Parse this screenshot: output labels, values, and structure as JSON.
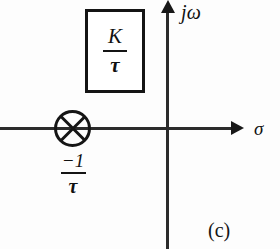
{
  "figure": {
    "subfigure_label": "(c)"
  },
  "axes": {
    "vertical_label": "jω",
    "horizontal_label": "σ",
    "origin": {
      "x": 167,
      "y": 128
    }
  },
  "gain_box": {
    "numerator": "K",
    "bar": "",
    "denominator": "τ",
    "value_text": "K/τ"
  },
  "pole_marker": {
    "symbol": "circled-x",
    "location_label_numerator": "−1",
    "location_label_bar": "",
    "location_label_denominator": "τ",
    "location_text": "-1/τ"
  },
  "colors": {
    "ink": "#141414",
    "axis": "#2b2b2b",
    "background": "#fdfdfd"
  }
}
